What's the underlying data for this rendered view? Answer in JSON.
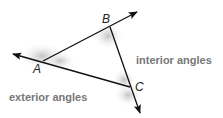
{
  "diagram": {
    "vertices": [
      {
        "label": "A",
        "x": 43,
        "y": 61
      },
      {
        "label": "B",
        "x": 110,
        "y": 27
      },
      {
        "label": "C",
        "x": 130,
        "y": 87
      }
    ],
    "labels": {
      "interior": "interior angles",
      "exterior": "exterior angles"
    },
    "colors": {
      "line": "#111111",
      "label_text": "#777777",
      "shading": "#bdbdbd"
    }
  }
}
